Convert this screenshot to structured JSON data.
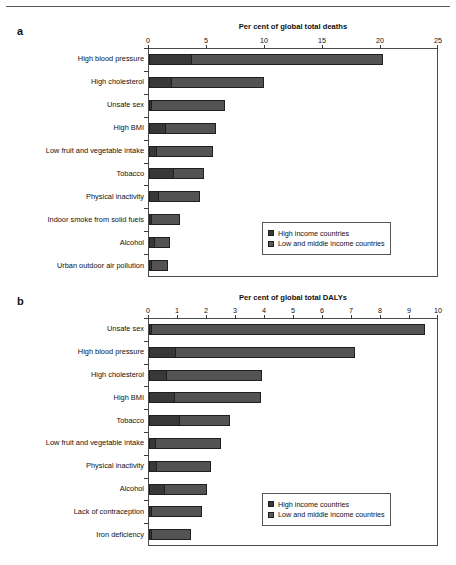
{
  "figure": {
    "panel_a_letter": "a",
    "panel_b_letter": "b",
    "legend": {
      "high_label": "High income countries",
      "low_label": "Low and middle income countries",
      "high_color": "#383838",
      "low_color": "#5a5a5a"
    }
  },
  "chart_data": [
    {
      "type": "bar",
      "orientation": "horizontal",
      "stacked": true,
      "panel": "a",
      "title": "Per cent of global total deaths",
      "xlabel": "Per cent of global total deaths",
      "ylabel": "",
      "xlim": [
        0,
        25
      ],
      "xticks": [
        0,
        5,
        10,
        15,
        20,
        25
      ],
      "grid": false,
      "legend_position": "bottom-right",
      "categories": [
        "High blood pressure",
        "High cholesterol",
        "Unsafe sex",
        "High BMI",
        "Low fruit and vegetable intake",
        "Tobacco",
        "Physical inactivity",
        "Indoor smoke from solid fuels",
        "Alcohol",
        "Urban outdoor air pollution"
      ],
      "series": [
        {
          "name": "High income countries",
          "color": "#383838",
          "values": [
            3.6,
            1.9,
            0.1,
            1.4,
            0.6,
            2.1,
            0.8,
            0.05,
            0.4,
            0.1
          ]
        },
        {
          "name": "Low and middle income countries",
          "color": "#535353",
          "values": [
            16.6,
            8.0,
            6.4,
            4.4,
            4.9,
            2.6,
            3.6,
            2.5,
            1.4,
            1.5
          ]
        }
      ],
      "totals": [
        20.2,
        9.9,
        6.5,
        5.8,
        5.5,
        4.7,
        4.4,
        2.55,
        1.8,
        1.6
      ]
    },
    {
      "type": "bar",
      "orientation": "horizontal",
      "stacked": true,
      "panel": "b",
      "title": "Per cent of global total DALYs",
      "xlabel": "Per cent of global total DALYs",
      "ylabel": "",
      "xlim": [
        0,
        10
      ],
      "xticks": [
        0,
        1,
        2,
        3,
        4,
        5,
        6,
        7,
        8,
        9,
        10
      ],
      "grid": false,
      "legend_position": "bottom-right",
      "categories": [
        "Unsafe sex",
        "High blood pressure",
        "High cholesterol",
        "High BMI",
        "Tobacco",
        "Low fruit and vegetable intake",
        "Physical inactivity",
        "Alcohol",
        "Lack of contraception",
        "Iron deficiency"
      ],
      "series": [
        {
          "name": "High income countries",
          "color": "#383838",
          "values": [
            0.05,
            0.9,
            0.6,
            0.85,
            1.05,
            0.2,
            0.25,
            0.5,
            0.02,
            0.05
          ]
        },
        {
          "name": "Low and middle income countries",
          "color": "#535353",
          "values": [
            9.45,
            6.2,
            3.3,
            3.0,
            1.75,
            2.3,
            1.9,
            1.5,
            1.78,
            1.4
          ]
        }
      ],
      "totals": [
        9.5,
        7.1,
        3.9,
        3.85,
        2.8,
        2.5,
        2.15,
        2.0,
        1.8,
        1.45
      ]
    }
  ]
}
